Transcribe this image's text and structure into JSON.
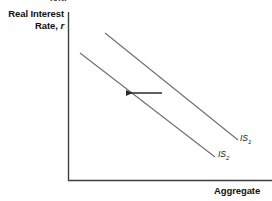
{
  "figure": {
    "top_remnant_text": "left.",
    "background_color": "#ffffff",
    "axis_color": "#3d3d3d",
    "curve_color": "#6e6e6e",
    "arrow_color": "#2b2b2b",
    "text_color": "#111111"
  },
  "axes": {
    "y_label_line1": "Real Interest",
    "y_label_line2": "Rate,",
    "y_label_variable": "r",
    "x_label": "Aggregate"
  },
  "curves": [
    {
      "id": "is1",
      "label": "IS",
      "subscript": "1",
      "label_full": "IS1",
      "start": {
        "x": 105,
        "y": 33
      },
      "end": {
        "x": 238,
        "y": 140
      }
    },
    {
      "id": "is2",
      "label": "IS",
      "subscript": "2",
      "label_full": "IS2",
      "start": {
        "x": 80,
        "y": 53
      },
      "end": {
        "x": 215,
        "y": 157
      }
    }
  ],
  "annotation": {
    "arrow_name": "shift-left-arrow",
    "direction": "left",
    "from_x": 162,
    "to_x": 123,
    "y": 93
  },
  "chart_data": {
    "type": "line",
    "title": "",
    "xlabel": "Aggregate",
    "ylabel": "Real Interest Rate, r",
    "grid": false,
    "legend": "inline-curve-labels",
    "annotations": [
      "leftward shift arrow"
    ],
    "series": [
      {
        "name": "IS1",
        "x": [
          105,
          238
        ],
        "y": [
          33,
          140
        ],
        "description": "original IS curve, downward sloping"
      },
      {
        "name": "IS2",
        "x": [
          80,
          215
        ],
        "y": [
          53,
          157
        ],
        "description": "shifted IS curve, downward sloping, shifted left/down"
      }
    ]
  }
}
